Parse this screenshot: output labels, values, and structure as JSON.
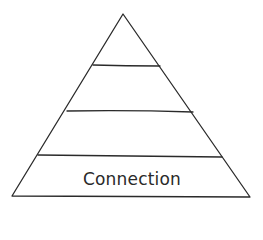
{
  "diagram": {
    "type": "pyramid",
    "levels": 4,
    "labels": [
      "",
      "",
      "",
      "Connection"
    ],
    "bottom_label": "Connection",
    "stroke_color": "#2a2a2a",
    "background": "#ffffff"
  }
}
